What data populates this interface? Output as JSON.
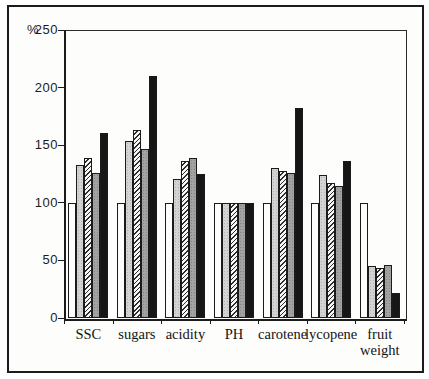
{
  "chart_data": {
    "type": "bar",
    "title": "",
    "ylabel": "%",
    "xlabel": "",
    "ylim": [
      0,
      250
    ],
    "yticks": [
      250,
      200,
      150,
      100,
      50,
      0
    ],
    "grid": true,
    "legend_position": "none",
    "categories": [
      "SSC",
      "sugars",
      "acidity",
      "PH",
      "carotene",
      "lycopene",
      "fruit weight"
    ],
    "series": [
      {
        "name": "control-white",
        "fill": "white",
        "values": [
          100,
          100,
          100,
          100,
          100,
          100,
          100
        ]
      },
      {
        "name": "series-light-gray",
        "fill": "light-gray-stipple",
        "values": [
          133,
          154,
          121,
          100,
          130,
          124,
          45
        ]
      },
      {
        "name": "series-hatched",
        "fill": "diagonal-hatch",
        "values": [
          139,
          163,
          136,
          100,
          128,
          117,
          43
        ]
      },
      {
        "name": "series-dark-gray",
        "fill": "dark-gray-stipple",
        "values": [
          126,
          147,
          139,
          100,
          126,
          115,
          46
        ]
      },
      {
        "name": "series-black",
        "fill": "black",
        "values": [
          161,
          210,
          125,
          100,
          182,
          136,
          22
        ]
      }
    ],
    "colors": {
      "outline": "#1a1a1a",
      "white_fill": "#fdfdfd",
      "light_gray_fill": "#d3d3d3",
      "dark_gray_fill": "#a2a2a2",
      "black_fill": "#161616",
      "gridline": "#6f6f6f",
      "frame": "#1b1b1b"
    }
  }
}
